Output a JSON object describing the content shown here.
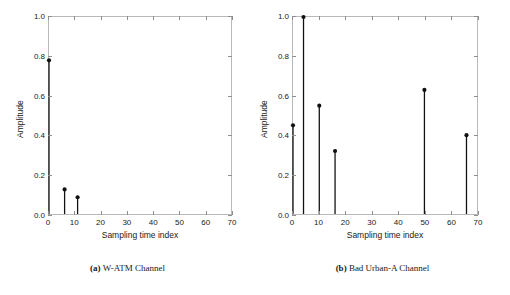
{
  "figure": {
    "panels": [
      {
        "id": "a",
        "caption_tag": "(a)",
        "caption_text": "W-ATM Channel",
        "chart": {
          "type": "stem",
          "title": "",
          "xlabel": "Sampling time index",
          "ylabel": "Amplitude",
          "xlim": [
            0,
            70
          ],
          "ylim": [
            0.0,
            1.0
          ],
          "xticks": [
            0,
            10,
            20,
            30,
            40,
            50,
            60,
            70
          ],
          "xticklabels": [
            "0",
            "10",
            "20",
            "30",
            "40",
            "50",
            "60",
            "70"
          ],
          "yticks": [
            0.0,
            0.2,
            0.4,
            0.6,
            0.8,
            1.0
          ],
          "yticklabels": [
            "0.0",
            "0.2",
            "0.4",
            "0.6",
            "0.8",
            "1.0"
          ],
          "grid": false,
          "legend": "none",
          "x": [
            0,
            6,
            11
          ],
          "values": [
            0.78,
            0.125,
            0.085
          ]
        }
      },
      {
        "id": "b",
        "caption_tag": "(b)",
        "caption_text": "Bad Urban-A Channel",
        "chart": {
          "type": "stem",
          "title": "",
          "xlabel": "Sampling time index",
          "ylabel": "Amplitude",
          "xlim": [
            0,
            70
          ],
          "ylim": [
            0.0,
            1.0
          ],
          "xticks": [
            0,
            10,
            20,
            30,
            40,
            50,
            60,
            70
          ],
          "xticklabels": [
            "0",
            "10",
            "20",
            "30",
            "40",
            "50",
            "60",
            "70"
          ],
          "yticks": [
            0.0,
            0.2,
            0.4,
            0.6,
            0.8,
            1.0
          ],
          "yticklabels": [
            "0.0",
            "0.2",
            "0.4",
            "0.6",
            "0.8",
            "1.0"
          ],
          "grid": false,
          "legend": "none",
          "x": [
            0,
            4,
            10,
            16,
            50,
            66
          ],
          "values": [
            0.45,
            1.0,
            0.55,
            0.32,
            0.63,
            0.4
          ]
        }
      }
    ]
  },
  "chart_data": [
    {
      "type": "stem",
      "title": "(a) W-ATM Channel",
      "xlabel": "Sampling time index",
      "ylabel": "Amplitude",
      "xlim": [
        0,
        70
      ],
      "ylim": [
        0.0,
        1.0
      ],
      "grid": false,
      "legend": "none",
      "x": [
        0,
        6,
        11
      ],
      "values": [
        0.78,
        0.125,
        0.085
      ],
      "xticks": [
        0,
        10,
        20,
        30,
        40,
        50,
        60,
        70
      ],
      "yticks": [
        0.0,
        0.2,
        0.4,
        0.6,
        0.8,
        1.0
      ]
    },
    {
      "type": "stem",
      "title": "(b) Bad Urban-A Channel",
      "xlabel": "Sampling time index",
      "ylabel": "Amplitude",
      "xlim": [
        0,
        70
      ],
      "ylim": [
        0.0,
        1.0
      ],
      "grid": false,
      "legend": "none",
      "x": [
        0,
        4,
        10,
        16,
        50,
        66
      ],
      "values": [
        0.45,
        1.0,
        0.55,
        0.32,
        0.63,
        0.4
      ],
      "xticks": [
        0,
        10,
        20,
        30,
        40,
        50,
        60,
        70
      ],
      "yticks": [
        0.0,
        0.2,
        0.4,
        0.6,
        0.8,
        1.0
      ]
    }
  ],
  "style": {
    "stem_color": "#111111",
    "frame_color": "#b9b9b9",
    "text_color": "#1a1a1a"
  }
}
